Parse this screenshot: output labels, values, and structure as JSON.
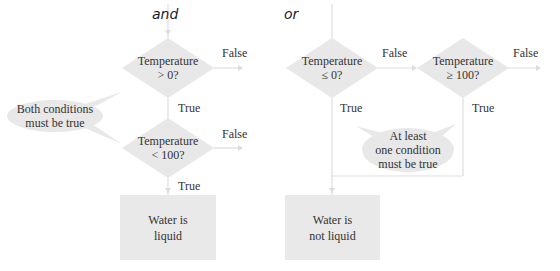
{
  "colors": {
    "shape_fill": "#e8e8e8",
    "connector": "#dddddd",
    "text": "#333333",
    "background": "#ffffff"
  },
  "and_flow": {
    "title": "and",
    "decision1": {
      "line1": "Temperature",
      "line2": "> 0?",
      "false_label": "False",
      "true_label": "True"
    },
    "decision2": {
      "line1": "Temperature",
      "line2": "< 100?",
      "false_label": "False",
      "true_label": "True"
    },
    "callout": {
      "line1": "Both conditions",
      "line2": "must be true"
    },
    "result": {
      "line1": "Water is",
      "line2": "liquid"
    }
  },
  "or_flow": {
    "title": "or",
    "decision1": {
      "line1": "Temperature",
      "line2": "≤ 0?",
      "false_label": "False",
      "true_label": "True"
    },
    "decision2": {
      "line1": "Temperature",
      "line2": "≥ 100?",
      "false_label": "False",
      "true_label": "True"
    },
    "callout": {
      "line1": "At least",
      "line2": "one condition",
      "line3": "must be true"
    },
    "result": {
      "line1": "Water is",
      "line2": "not liquid"
    }
  }
}
